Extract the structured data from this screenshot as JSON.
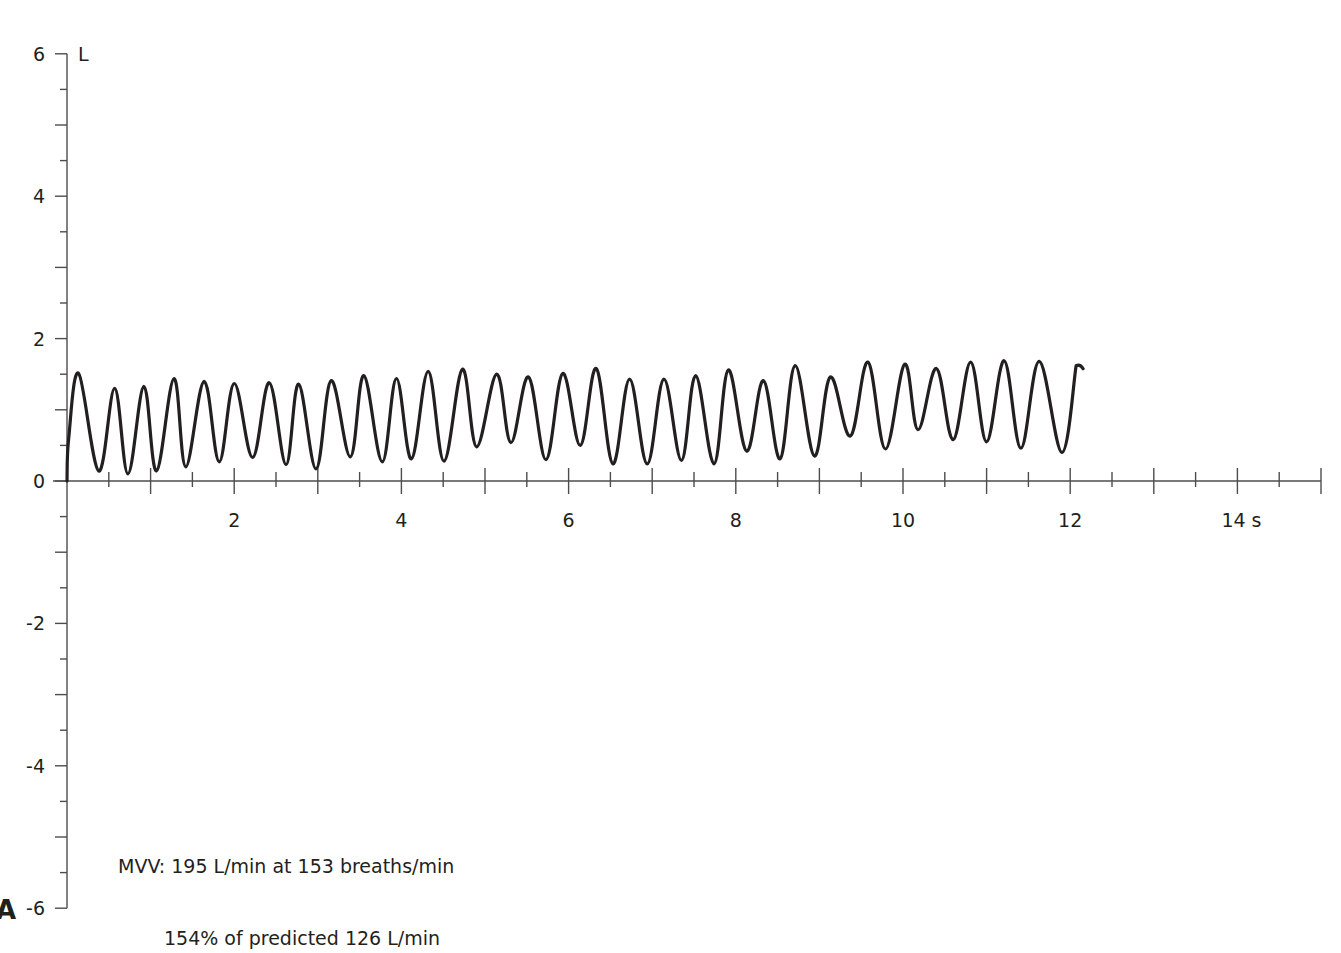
{
  "panel_label": "A",
  "annotation": {
    "line1": "MVV: 195 L/min at 153 breaths/min",
    "line2": "154% of predicted 126 L/min"
  },
  "axes": {
    "y_unit": "L",
    "x_unit": "s",
    "y_ticks": [
      6,
      4,
      2,
      0,
      -2,
      -4,
      -6
    ],
    "y_tick_labels": [
      "6",
      "4",
      "2",
      "0",
      "-2",
      "-4",
      "-6"
    ],
    "x_ticks": [
      2,
      4,
      6,
      8,
      10,
      12,
      14
    ],
    "x_tick_labels": [
      "2",
      "4",
      "6",
      "8",
      "10",
      "12",
      "14 s"
    ]
  },
  "colors": {
    "trace": "#231f20",
    "axis": "#4d4d4d"
  },
  "chart_data": {
    "type": "line",
    "title": "",
    "xlabel": "s",
    "ylabel": "L",
    "xlim": [
      0,
      15
    ],
    "ylim": [
      -6,
      6
    ],
    "grid": false,
    "legend": null,
    "x_major_tick_step": 1,
    "x_minor_tick_step": 0.5,
    "y_major_tick_step": 1,
    "y_minor_tick_step": 0.5,
    "annotations": [
      "MVV: 195 L/min at 153 breaths/min",
      "154% of predicted 126 L/min"
    ],
    "series": [
      {
        "name": "Volume (MVV manoeuvre)",
        "x": [
          0.0,
          0.02,
          0.14,
          0.38,
          0.57,
          0.73,
          0.92,
          1.07,
          1.28,
          1.42,
          1.64,
          1.82,
          2.0,
          2.22,
          2.42,
          2.62,
          2.77,
          2.98,
          3.16,
          3.39,
          3.55,
          3.77,
          3.94,
          4.12,
          4.32,
          4.51,
          4.73,
          4.9,
          5.14,
          5.31,
          5.52,
          5.73,
          5.93,
          6.14,
          6.33,
          6.53,
          6.73,
          6.94,
          7.14,
          7.35,
          7.52,
          7.74,
          7.91,
          8.13,
          8.33,
          8.53,
          8.71,
          8.94,
          9.13,
          9.37,
          9.58,
          9.79,
          10.02,
          10.18,
          10.4,
          10.6,
          10.81,
          11.0,
          11.21,
          11.41,
          11.63,
          11.9,
          12.07
        ],
        "y": [
          0.0,
          0.6,
          1.51,
          0.14,
          1.3,
          0.1,
          1.33,
          0.14,
          1.44,
          0.2,
          1.4,
          0.27,
          1.37,
          0.33,
          1.38,
          0.23,
          1.36,
          0.17,
          1.41,
          0.34,
          1.48,
          0.27,
          1.44,
          0.31,
          1.54,
          0.28,
          1.57,
          0.48,
          1.5,
          0.54,
          1.46,
          0.3,
          1.51,
          0.5,
          1.58,
          0.24,
          1.43,
          0.24,
          1.43,
          0.29,
          1.48,
          0.24,
          1.56,
          0.42,
          1.41,
          0.31,
          1.62,
          0.35,
          1.46,
          0.63,
          1.67,
          0.45,
          1.64,
          0.72,
          1.58,
          0.58,
          1.67,
          0.55,
          1.69,
          0.46,
          1.68,
          0.4,
          1.62
        ]
      }
    ]
  }
}
